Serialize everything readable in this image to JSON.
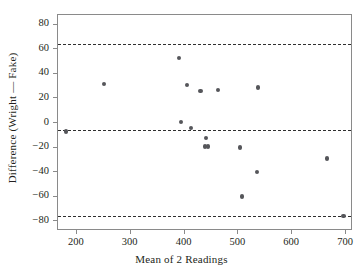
{
  "chart_data": {
    "type": "scatter",
    "title": "",
    "xlabel": "Mean of 2 Readings",
    "ylabel": "Difference (Wright — Fake)",
    "xlim": [
      165,
      713
    ],
    "ylim": [
      -88,
      88
    ],
    "grid": false,
    "legend": null,
    "xticks": [
      200,
      300,
      400,
      500,
      600,
      700
    ],
    "yticks": [
      80,
      60,
      40,
      20,
      0,
      -20,
      -40,
      -60,
      -80
    ],
    "xtick_labels": [
      "200",
      "300",
      "400",
      "500",
      "600",
      "700"
    ],
    "ytick_labels": [
      "80",
      "60",
      "40",
      "20",
      "0",
      "−20",
      "−40",
      "−60",
      "−80"
    ],
    "marker_color": "#55565a",
    "line_color": "#2f2f2f",
    "frame_color": "#8a8a8a",
    "points": [
      {
        "x": 180,
        "y": -7
      },
      {
        "x": 250,
        "y": 32
      },
      {
        "x": 390,
        "y": 53
      },
      {
        "x": 393,
        "y": 1
      },
      {
        "x": 405,
        "y": 31
      },
      {
        "x": 412,
        "y": -4
      },
      {
        "x": 430,
        "y": 26
      },
      {
        "x": 440,
        "y": -12
      },
      {
        "x": 438,
        "y": -19
      },
      {
        "x": 444,
        "y": -19
      },
      {
        "x": 462,
        "y": 27
      },
      {
        "x": 503,
        "y": -20
      },
      {
        "x": 507,
        "y": -60
      },
      {
        "x": 537,
        "y": 29
      },
      {
        "x": 535,
        "y": -40
      },
      {
        "x": 665,
        "y": -29
      },
      {
        "x": 695,
        "y": -76
      }
    ],
    "reference_lines": [
      {
        "name": "upper-limit-of-agreement",
        "y": 64,
        "style": "dashed"
      },
      {
        "name": "mean-difference",
        "y": -5.5,
        "style": "dashed"
      },
      {
        "name": "lower-limit-of-agreement",
        "y": -76,
        "style": "dashed"
      }
    ]
  }
}
